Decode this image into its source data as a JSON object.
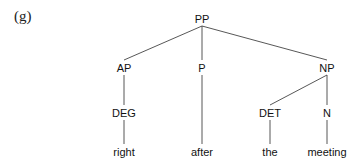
{
  "example_label": "(g)",
  "tree": {
    "nodes": [
      {
        "id": "PP",
        "label": "PP",
        "x": 202,
        "y": 13
      },
      {
        "id": "AP",
        "label": "AP",
        "x": 124,
        "y": 62
      },
      {
        "id": "P",
        "label": "P",
        "x": 202,
        "y": 62
      },
      {
        "id": "NP",
        "label": "NP",
        "x": 327,
        "y": 62
      },
      {
        "id": "DEG",
        "label": "DEG",
        "x": 124,
        "y": 107
      },
      {
        "id": "DET",
        "label": "DET",
        "x": 270,
        "y": 107
      },
      {
        "id": "N",
        "label": "N",
        "x": 327,
        "y": 107
      },
      {
        "id": "w1",
        "label": "right",
        "x": 124,
        "y": 146
      },
      {
        "id": "w2",
        "label": "after",
        "x": 202,
        "y": 146
      },
      {
        "id": "w3",
        "label": "the",
        "x": 270,
        "y": 146
      },
      {
        "id": "w4",
        "label": "meeting",
        "x": 327,
        "y": 146
      }
    ],
    "edges": [
      [
        "PP",
        "AP"
      ],
      [
        "PP",
        "P"
      ],
      [
        "PP",
        "NP"
      ],
      [
        "AP",
        "DEG"
      ],
      [
        "NP",
        "DET"
      ],
      [
        "NP",
        "N"
      ],
      [
        "DEG",
        "w1"
      ],
      [
        "P",
        "w2"
      ],
      [
        "DET",
        "w3"
      ],
      [
        "N",
        "w4"
      ]
    ]
  }
}
